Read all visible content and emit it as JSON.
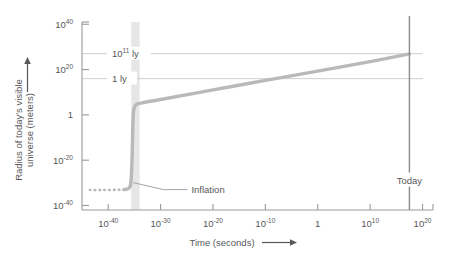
{
  "chart_data": {
    "type": "line",
    "title": "",
    "xlabel": "Time (seconds)",
    "ylabel": "Radius of today's visible universe (meters)",
    "xlabel_arrow": "⟶",
    "ylabel_arrow": "↑",
    "grid": false,
    "legend": "none",
    "xscale": "log",
    "yscale": "log",
    "xlim_exp": [
      -45,
      22
    ],
    "ylim_exp": [
      -42,
      41
    ],
    "x_ticks": [
      {
        "mantissa": "10",
        "exponent": "-40",
        "value_exp": -40
      },
      {
        "mantissa": "10",
        "exponent": "-30",
        "value_exp": -30
      },
      {
        "mantissa": "10",
        "exponent": "-20",
        "value_exp": -20
      },
      {
        "mantissa": "10",
        "exponent": "-10",
        "value_exp": -10
      },
      {
        "mantissa": "1",
        "exponent": "",
        "value_exp": 0
      },
      {
        "mantissa": "10",
        "exponent": "10",
        "value_exp": 10
      },
      {
        "mantissa": "10",
        "exponent": "20",
        "value_exp": 20
      }
    ],
    "y_ticks": [
      {
        "mantissa": "10",
        "exponent": "40",
        "value_exp": 40
      },
      {
        "mantissa": "10",
        "exponent": "20",
        "value_exp": 20
      },
      {
        "mantissa": "1",
        "exponent": "",
        "value_exp": 0
      },
      {
        "mantissa": "10",
        "exponent": "-20",
        "value_exp": -20
      },
      {
        "mantissa": "10",
        "exponent": "-40",
        "value_exp": -40
      }
    ],
    "reference_lines": [
      {
        "label_mantissa": "10",
        "label_exponent": "11",
        "label_unit": "ly",
        "y_exp": 27.0
      },
      {
        "label_mantissa": "1",
        "label_exponent": "",
        "label_unit": "ly",
        "y_exp": 16.0
      }
    ],
    "annotations": [
      {
        "text": "Inflation",
        "x_exp": -24.5,
        "y_exp": -33.0
      },
      {
        "text": "Today",
        "x_exp": 17.5,
        "y_exp": -29.0
      }
    ],
    "today_marker": {
      "label": "Today",
      "x_exp": 17.5
    },
    "inflation_band": {
      "x_start_exp": -35.6,
      "x_end_exp": -34.0
    },
    "series": [
      {
        "name": "pre-inflation (extrapolated)",
        "style": "dotted",
        "points": [
          {
            "x_exp": -43.5,
            "y_exp": -33.2
          },
          {
            "x_exp": -41.0,
            "y_exp": -33.2
          },
          {
            "x_exp": -38.5,
            "y_exp": -33.1
          },
          {
            "x_exp": -37.0,
            "y_exp": -33.0
          }
        ]
      },
      {
        "name": "radius of visible universe",
        "style": "solid",
        "points": [
          {
            "x_exp": -37.0,
            "y_exp": -33.0
          },
          {
            "x_exp": -36.2,
            "y_exp": -32.6
          },
          {
            "x_exp": -35.8,
            "y_exp": -31.5
          },
          {
            "x_exp": -35.6,
            "y_exp": -28.0
          },
          {
            "x_exp": -35.45,
            "y_exp": -20.0
          },
          {
            "x_exp": -35.35,
            "y_exp": -10.0
          },
          {
            "x_exp": -35.25,
            "y_exp": -2.0
          },
          {
            "x_exp": -35.1,
            "y_exp": 2.5
          },
          {
            "x_exp": -34.6,
            "y_exp": 4.6
          },
          {
            "x_exp": -33.5,
            "y_exp": 5.3
          },
          {
            "x_exp": -30.0,
            "y_exp": 6.8
          },
          {
            "x_exp": -20.0,
            "y_exp": 11.0
          },
          {
            "x_exp": -10.0,
            "y_exp": 15.2
          },
          {
            "x_exp": 0.0,
            "y_exp": 19.3
          },
          {
            "x_exp": 10.0,
            "y_exp": 23.5
          },
          {
            "x_exp": 17.5,
            "y_exp": 26.9
          }
        ]
      }
    ],
    "colors": {
      "curve": "#b9b9b9",
      "reference_line": "#cfcfcf",
      "axis": "#9a9a9a",
      "today_line": "#8c8c8c",
      "inflation_band": "#e2e2e2",
      "text": "#58585a",
      "background": "#ffffff"
    }
  }
}
